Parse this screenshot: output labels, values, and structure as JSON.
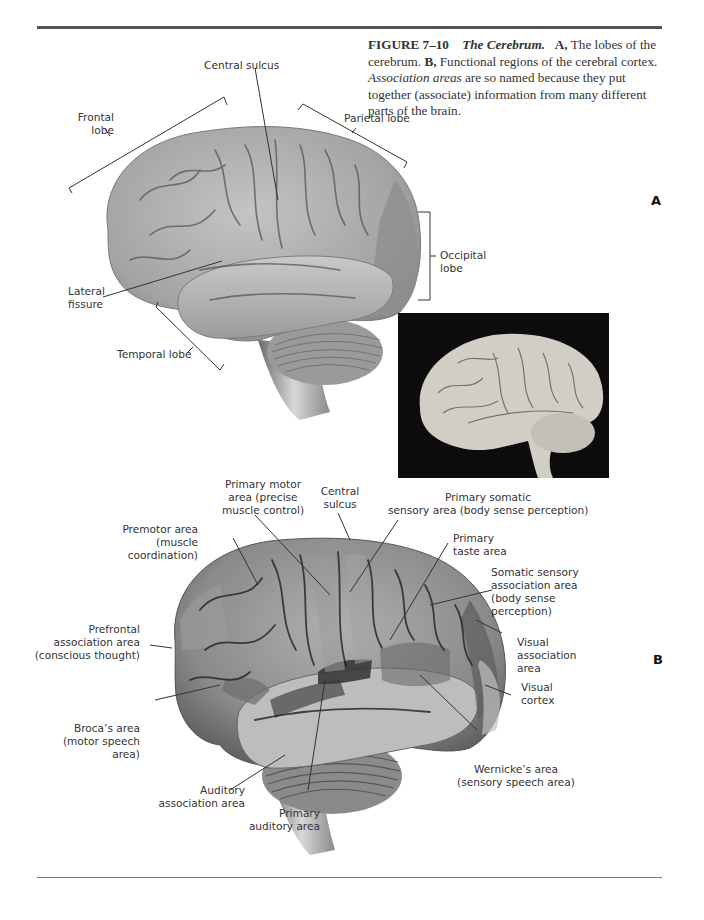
{
  "figure": {
    "number": "FIGURE 7–10",
    "title": "The Cerebrum.",
    "caption_parts": {
      "a_marker": "A,",
      "a_text": " The lobes of the cerebrum. ",
      "b_marker": "B,",
      "b_text": " Functional regions of the cerebral cortex. ",
      "emphasis": "Association areas",
      "rest": " are so named because they put together (associate) information from many different parts of the brain."
    }
  },
  "panel_a": {
    "letter": "A",
    "labels": {
      "central_sulcus": "Central sulcus",
      "frontal_lobe": [
        "Frontal",
        "lobe"
      ],
      "parietal_lobe": "Parietal lobe",
      "occipital_lobe": [
        "Occipital",
        "lobe"
      ],
      "lateral_fissure": [
        "Lateral",
        "fissure"
      ],
      "temporal_lobe": "Temporal lobe"
    },
    "photo": "photograph of human brain, lateral view"
  },
  "panel_b": {
    "letter": "B",
    "labels": {
      "primary_motor": [
        "Primary motor",
        "area (precise",
        "muscle control)"
      ],
      "central_sulcus": [
        "Central",
        "sulcus"
      ],
      "primary_somatic": [
        "Primary somatic",
        "sensory area (body sense perception)"
      ],
      "premotor": [
        "Premotor area",
        "(muscle",
        "coordination)"
      ],
      "primary_taste": [
        "Primary",
        "taste area"
      ],
      "somatic_assoc": [
        "Somatic sensory",
        "association area",
        "(body sense",
        "perception)"
      ],
      "prefrontal": [
        "Prefrontal",
        "association area",
        "(conscious thought)"
      ],
      "visual_assoc": [
        "Visual",
        "association",
        "area"
      ],
      "visual_cortex": [
        "Visual",
        "cortex"
      ],
      "broca": [
        "Broca’s area",
        "(motor speech",
        "area)"
      ],
      "auditory_assoc": [
        "Auditory",
        "association area"
      ],
      "primary_auditory": [
        "Primary",
        "auditory area"
      ],
      "wernicke": [
        "Wernicke’s area",
        "(sensory speech area)"
      ]
    }
  },
  "colors": {
    "brain_a": "#a9a9a9",
    "brain_b": "#8e8e8e",
    "lobe_occipital": "#8a8a8a",
    "region_dark": "#3f3f3f",
    "text": "#333333",
    "rule": "#555555"
  }
}
